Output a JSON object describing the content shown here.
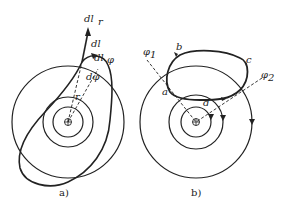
{
  "figure_a": {
    "caption": "a)",
    "labels": {
      "dl_r": "dl",
      "dl_r_sub": "r",
      "dl": "dl",
      "dl_phi": "dl",
      "dl_phi_sub": "φ",
      "dphi": "dφ",
      "r": "r"
    }
  },
  "figure_b": {
    "caption": "b)",
    "labels": {
      "phi1": "φ",
      "phi1_sub": "1",
      "phi2": "φ",
      "phi2_sub": "2",
      "a": "a",
      "b": "b",
      "c": "c",
      "d": "d"
    }
  },
  "colors": {
    "ink": "#222222",
    "background": "#ffffff"
  }
}
